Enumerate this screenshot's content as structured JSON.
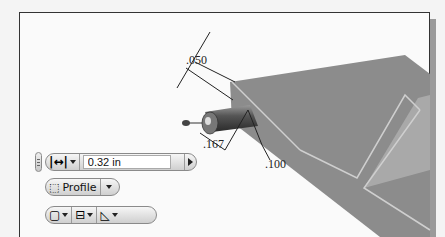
{
  "dimensions": {
    "thickness": ".050",
    "offset": ".167",
    "depth": ".100"
  },
  "mini_toolbar": {
    "row1": {
      "measure_icon": "distance-icon",
      "value_input": "0.32 in",
      "apply_icon": "play-arrow-icon"
    },
    "row2": {
      "profile_label": "Profile",
      "profile_icon": "profile-select-icon"
    },
    "row3": {
      "buttons": [
        "solid-box-icon",
        "extrude-direction-icon",
        "taper-icon"
      ]
    }
  },
  "colors": {
    "plate": "#8c8c8c",
    "plate_light": "#a8a8a8",
    "edge_highlight": "#cfcfcf",
    "background": "#fafafa"
  }
}
